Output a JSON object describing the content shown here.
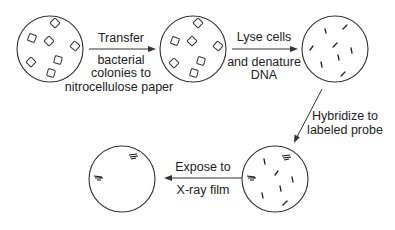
{
  "diagram": {
    "steps": [
      {
        "id": "plate-colonies",
        "content": "bacterial colonies"
      },
      {
        "id": "plate-nitrocellulose",
        "content": "colonies on nitrocellulose"
      },
      {
        "id": "plate-denatured",
        "content": "denatured DNA"
      },
      {
        "id": "plate-hybridized",
        "content": "hybridized DNA with probe"
      },
      {
        "id": "plate-film",
        "content": "X-ray film image"
      }
    ],
    "arrows": [
      {
        "from": "plate-colonies",
        "to": "plate-nitrocellulose",
        "label_top": "Transfer",
        "label_bottom": [
          "bacterial",
          "colonies to",
          "nitrocellulose paper"
        ]
      },
      {
        "from": "plate-nitrocellulose",
        "to": "plate-denatured",
        "label_top": "Lyse cells",
        "label_bottom": [
          "and denature",
          "DNA"
        ]
      },
      {
        "from": "plate-denatured",
        "to": "plate-hybridized",
        "label_side": [
          "Hybridize to",
          "labeled probe"
        ]
      },
      {
        "from": "plate-hybridized",
        "to": "plate-film",
        "label_top": "Expose to",
        "label_bottom": [
          "X-ray film"
        ]
      }
    ],
    "colors": {
      "stroke": "#333333",
      "text": "#222222",
      "background": "#ffffff"
    }
  }
}
